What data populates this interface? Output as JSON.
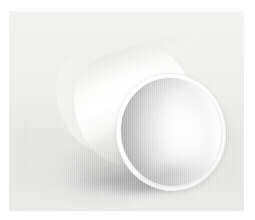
{
  "image": {
    "kind": "photograph",
    "subject": "white cylindrical tube",
    "subject_description": "A matte white open-ended cylinder (paper or plastic tube) resting on its side and tilted so the near circular opening faces the lower right of the frame.",
    "scene": "studio seamless sweep",
    "lighting": "soft diffuse key light from upper left",
    "shadow_direction": "lower left",
    "palette": {
      "background_top": "#f2f2f0",
      "background_mid": "#eeeeec",
      "background_bottom": "#e6e6e4",
      "object_highlight": "#ffffff",
      "object_midtone": "#f2f2f0",
      "object_shade": "#d2d2d0",
      "bore_shadow": "#969699",
      "cast_shadow": "#60606 3",
      "print_border": "#ffffff"
    },
    "frame": {
      "canvas_width": 255,
      "canvas_height": 220,
      "photo_left": 9,
      "photo_top": 11,
      "photo_width": 235,
      "photo_height": 200,
      "border_color": "#ffffff"
    },
    "objects": [
      {
        "name": "cylinder-barrel",
        "label": "Cylinder barrel",
        "tilt_degrees": -19
      },
      {
        "name": "cylinder-near-opening",
        "label": "Near open end",
        "tilt_degrees": -10
      },
      {
        "name": "cylinder-far-rim",
        "label": "Far rim"
      },
      {
        "name": "cast-shadow",
        "label": "Cast shadow"
      }
    ],
    "caption": ""
  }
}
